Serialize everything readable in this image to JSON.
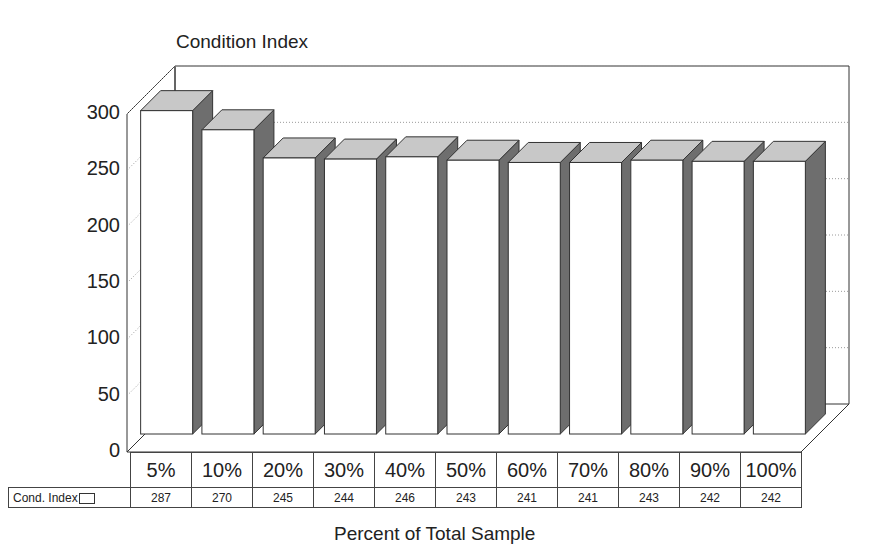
{
  "chart_data": {
    "type": "bar",
    "style": "3d",
    "title": "Condition Index",
    "xlabel": "Percent of Total Sample",
    "ylabel": "",
    "categories": [
      "5%",
      "10%",
      "20%",
      "30%",
      "40%",
      "50%",
      "60%",
      "70%",
      "80%",
      "90%",
      "100%"
    ],
    "series": [
      {
        "name": "Cond. Index",
        "values": [
          287,
          270,
          245,
          244,
          246,
          243,
          241,
          241,
          243,
          242,
          242
        ]
      }
    ],
    "yticks": [
      0,
      50,
      100,
      150,
      200,
      250,
      300
    ],
    "ylim": [
      0,
      300
    ],
    "grid": "dotted horizontal on back wall",
    "legend_position": "data table row label",
    "data_table": true
  },
  "colors": {
    "bar_front": "#ffffff",
    "bar_top": "#c8c8c8",
    "bar_side": "#6e6e6e",
    "outline": "#333333",
    "grid": "#9a9a9a"
  },
  "table": {
    "row_label": "Cond. Index"
  }
}
